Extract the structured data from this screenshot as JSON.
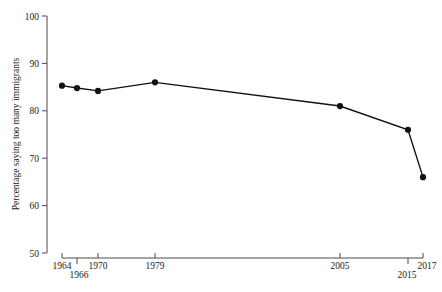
{
  "chart_data": {
    "type": "line",
    "title": "",
    "xlabel": "",
    "ylabel": "Percentage saying too many immigrants",
    "x": [
      1964,
      1966,
      1970,
      1979,
      2005,
      2015,
      2017
    ],
    "categories": [
      "1964",
      "1966",
      "1970",
      "1979",
      "2005",
      "2015",
      "2017"
    ],
    "values": [
      85.3,
      84.8,
      84.2,
      86.0,
      81.0,
      76.0,
      66.0
    ],
    "series": [
      {
        "name": "Percentage saying too many immigrants",
        "values": [
          85.3,
          84.8,
          84.2,
          86.0,
          81.0,
          76.0,
          66.0
        ]
      }
    ],
    "ylim": [
      50,
      100
    ],
    "yticks": [
      50,
      60,
      70,
      80,
      90,
      100
    ],
    "ytick_labels": [
      "50",
      "60",
      "70",
      "80",
      "90",
      "100"
    ],
    "xticks": [
      1964,
      1966,
      1970,
      1979,
      2005,
      2015,
      2017
    ],
    "xtick_labels": [
      "1964",
      "1966",
      "1970",
      "1979",
      "2005",
      "2015",
      "2017"
    ],
    "grid": false,
    "legend": "none",
    "marker": "filled-circle",
    "line_color": "#111111",
    "axis_color": "#4a4a4a"
  },
  "axes": {
    "y_title": "Percentage saying too many immigrants",
    "ytick_0": "50",
    "ytick_1": "60",
    "ytick_2": "70",
    "ytick_3": "80",
    "ytick_4": "90",
    "ytick_5": "100",
    "xtick_0": "1964",
    "xtick_1": "1966",
    "xtick_2": "1970",
    "xtick_3": "1979",
    "xtick_4": "2005",
    "xtick_5": "2015",
    "xtick_6": "2017"
  },
  "caption": {
    "text": ""
  }
}
